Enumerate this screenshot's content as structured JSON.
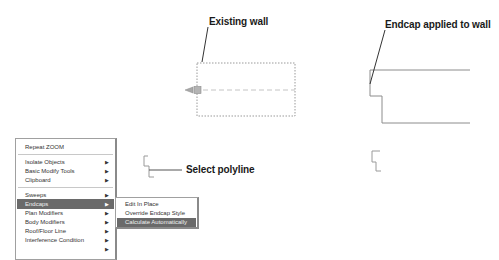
{
  "callouts": {
    "existing_wall": "Existing wall",
    "endcap_applied": "Endcap applied to wall",
    "select_polyline": "Select polyline"
  },
  "context_menu": {
    "items": [
      {
        "label": "Repeat ZOOM",
        "has_submenu": false
      },
      {
        "label": "Isolate Objects",
        "has_submenu": true
      },
      {
        "label": "Basic Modify Tools",
        "has_submenu": true
      },
      {
        "label": "Clipboard",
        "has_submenu": true
      },
      {
        "label": "Sweeps",
        "has_submenu": true
      },
      {
        "label": "Endcaps",
        "has_submenu": true,
        "active": true
      },
      {
        "label": "Plan Modifiers",
        "has_submenu": true
      },
      {
        "label": "Body Modifiers",
        "has_submenu": true
      },
      {
        "label": "Roof/Floor Line",
        "has_submenu": true
      },
      {
        "label": "Interference Condition",
        "has_submenu": true
      }
    ],
    "arrow_glyph": "▶"
  },
  "endcaps_submenu": {
    "items": [
      {
        "label": "Edit In Place"
      },
      {
        "label": "Override Endcap Style"
      },
      {
        "label": "Calculate Automatically",
        "active": true
      }
    ]
  },
  "colors": {
    "menu_highlight": "#6a6a6a",
    "wall_line": "#8c8c8c",
    "leader_line": "#333333"
  }
}
